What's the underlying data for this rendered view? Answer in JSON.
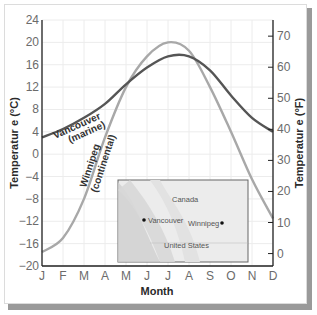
{
  "chart_data": {
    "type": "line",
    "title": "",
    "xlabel": "Month",
    "ylabel": "Temperatur e (°C)",
    "ylabel_right": "Temperatur e (°F)",
    "categories": [
      "J",
      "F",
      "M",
      "A",
      "M",
      "J",
      "J",
      "A",
      "S",
      "O",
      "N",
      "D"
    ],
    "ylim": [
      -20,
      24
    ],
    "yticks": [
      24,
      20,
      16,
      12,
      8,
      4,
      0,
      -4,
      -8,
      -12,
      -16,
      -20
    ],
    "ylim_right": [
      -4,
      75
    ],
    "yticks_right": [
      70,
      60,
      50,
      40,
      30,
      20,
      10,
      0
    ],
    "grid": true,
    "series": [
      {
        "name": "Vancouver (marine)",
        "label_line1": "Vancouver",
        "label_line2": "(marine)",
        "color": "#555555",
        "values": [
          3,
          4.5,
          6.5,
          9,
          12.5,
          15.5,
          17.5,
          17.5,
          15,
          10.5,
          6.5,
          4
        ]
      },
      {
        "name": "Winnipeg (continental)",
        "label_line1": "Winnipeg",
        "label_line2": "(continental)",
        "color": "#a8a8a8",
        "values": [
          -17.5,
          -15,
          -8,
          3,
          12,
          17.5,
          20,
          18.5,
          12,
          4,
          -4.5,
          -11.5
        ]
      }
    ],
    "inset_map": {
      "labels": {
        "country_north": "Canada",
        "country_south": "United States",
        "city_west": "Vancouver",
        "city_east": "Winnipeg"
      }
    }
  }
}
